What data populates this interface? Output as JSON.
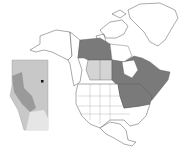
{
  "map": {
    "title": "",
    "region": "North America",
    "inset": {
      "region": "Alberta",
      "marker": {
        "shape": "square",
        "color": "#111111"
      }
    },
    "highlighted_regions": {
      "dark": [
        "Northwest Territories (mainland)",
        "Saskatchewan",
        "Manitoba",
        "Ontario",
        "Quebec",
        "New Brunswick",
        "Nova Scotia",
        "Prince Edward Island",
        "Minnesota",
        "Wisconsin",
        "Michigan",
        "Iowa",
        "Illinois",
        "Indiana",
        "Ohio",
        "Pennsylvania",
        "New York",
        "Vermont",
        "New Hampshire",
        "Maine",
        "Massachusetts",
        "Connecticut",
        "Rhode Island",
        "New Jersey",
        "Maryland",
        "Delaware",
        "West Virginia",
        "Kentucky",
        "Missouri (north)"
      ],
      "light": [
        "Alberta",
        "Saskatchewan (inset region)"
      ]
    },
    "colors": {
      "background": "#ffffff",
      "outline": "#555555",
      "land": "#ffffff",
      "dark_fill": "#7a7a7a",
      "light_fill": "#d4d4d4",
      "inset_base": "#c8c8c8",
      "inset_dark": "#9a9a9a",
      "inset_light": "#e6e6e6",
      "marker": "#111111"
    }
  }
}
